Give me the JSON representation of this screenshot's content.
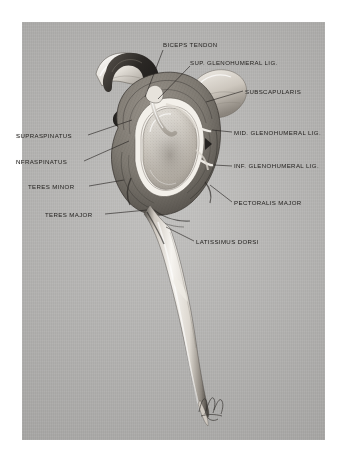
{
  "figure": {
    "plate_color": "#b6b5b3",
    "ink_color": "#23211f",
    "mount_color": "#ffffff",
    "signature": "artist-monogram"
  },
  "labels": [
    {
      "id": "biceps-tendon",
      "text": "BICEPS TENDON",
      "side": "top",
      "x": 163,
      "y": 42,
      "leader": "M163,50 L144,96"
    },
    {
      "id": "sup-glenohumeral-lig",
      "text": "SUP.  GLENOHUMERAL LIG.",
      "side": "top",
      "x": 190,
      "y": 60,
      "leader": "M190,66 L157,99"
    },
    {
      "id": "subscapularis",
      "text": "SUBSCAPULARIS",
      "side": "right",
      "x": 245,
      "y": 93,
      "leader": "M243,91 L205,101"
    },
    {
      "id": "mid-glenohumeral-lig",
      "text": "MID. GLENOHUMERAL LIG.",
      "side": "right",
      "x": 234,
      "y": 134,
      "leader": "M232,132 L211,130"
    },
    {
      "id": "inf-glenohumeral-lig",
      "text": "INF. GLENOHUMERAL LIG.",
      "side": "right",
      "x": 234,
      "y": 168,
      "leader": "M232,166 L213,165"
    },
    {
      "id": "pectoralis-major",
      "text": "PECTORALIS MAJOR",
      "side": "right",
      "x": 234,
      "y": 205,
      "leader": "M232,202 L211,186"
    },
    {
      "id": "latissimus-dorsi",
      "text": "LATISSIMUS DORSI",
      "side": "right",
      "x": 196,
      "y": 243,
      "leader": "M194,241 L167,228"
    },
    {
      "id": "supraspinatus",
      "text": "SUPRASPINATUS",
      "side": "left",
      "x": 16,
      "y": 137,
      "leader": "M88,135 L131,120"
    },
    {
      "id": "infraspinatus",
      "text": "NFRASPINATUS",
      "side": "left",
      "x": 16,
      "y": 163,
      "leader": "M84,161 L128,140"
    },
    {
      "id": "teres-minor",
      "text": "TERES MINOR",
      "side": "left",
      "x": 28,
      "y": 188,
      "leader": "M89,186 L123,180"
    },
    {
      "id": "teres-major",
      "text": "TERES MAJOR",
      "side": "left",
      "x": 45,
      "y": 216,
      "leader": "M105,214 L146,210"
    }
  ],
  "structures": [
    {
      "id": "acromion-arch",
      "name": "acromion / coracoacromial arch"
    },
    {
      "id": "clavicle",
      "name": "clavicle"
    },
    {
      "id": "glenoid-fossa",
      "name": "glenoid cavity"
    },
    {
      "id": "glenoid-labrum",
      "name": "glenoid labrum"
    },
    {
      "id": "joint-capsule",
      "name": "joint capsule"
    },
    {
      "id": "coracoid",
      "name": "coracoid process"
    },
    {
      "id": "humerus-shaft",
      "name": "humerus shaft"
    }
  ]
}
